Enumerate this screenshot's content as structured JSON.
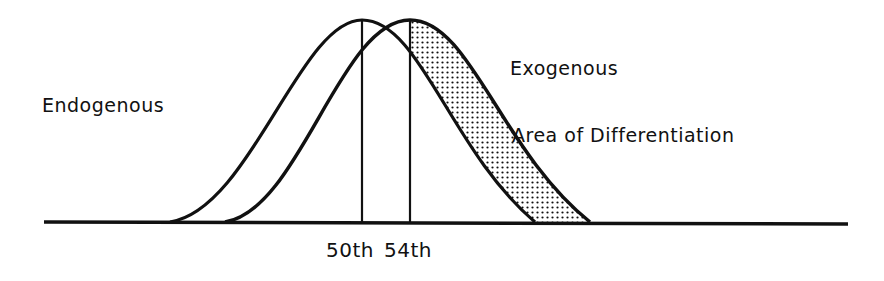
{
  "diagram": {
    "labels": {
      "endogenous": "Endogenous",
      "exogenous": "Exogenous",
      "area": "Area of Differentiation",
      "percentile_50": "50th",
      "percentile_54": "54th"
    },
    "colors": {
      "stroke": "#111111",
      "background": "#ffffff",
      "shading": "#111111"
    },
    "curves": [
      {
        "name": "Endogenous",
        "peak_x": 362,
        "left_x": 170,
        "right_x": 535
      },
      {
        "name": "Exogenous",
        "peak_x": 410,
        "left_x": 225,
        "right_x": 590
      }
    ],
    "markers": [
      {
        "label": "50th",
        "x": 362
      },
      {
        "label": "54th",
        "x": 410
      }
    ]
  }
}
